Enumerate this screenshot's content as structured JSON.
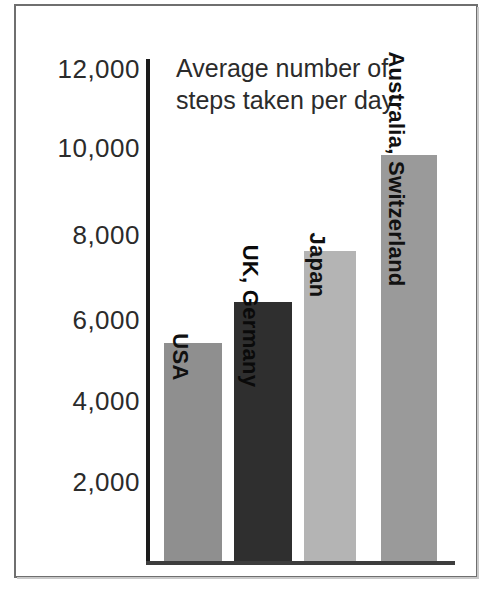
{
  "chart_data": {
    "type": "bar",
    "title": "Average number of steps taken per day",
    "title_line1": "Average number of",
    "title_line2": "steps taken per day",
    "xlabel": "",
    "ylabel": "",
    "ylim": [
      0,
      12000
    ],
    "grid": false,
    "legend": "none",
    "orientation": "vertical",
    "y_ticks": [
      12000,
      10000,
      8000,
      6000,
      4000,
      2000
    ],
    "y_tick_labels": [
      "12,000",
      "10,000",
      "8,000",
      "6,000",
      "4,000",
      "2,000"
    ],
    "categories": [
      "USA",
      "UK, Germany",
      "Japan",
      "Australia, Switzerland"
    ],
    "values": [
      5200,
      6200,
      7400,
      9700
    ],
    "bar_colors": [
      "#8f8f8f",
      "#2f2f2f",
      "#b4b4b4",
      "#9a9a9a"
    ],
    "series": [
      {
        "name": "Average steps per day",
        "values": [
          5200,
          6200,
          7400,
          9700
        ]
      }
    ],
    "annotations": [
      "Bar labels are printed vertically inside each bar"
    ]
  },
  "axis": {
    "tick_0": "12,000",
    "tick_1": "10,000",
    "tick_2": "8,000",
    "tick_3": "6,000",
    "tick_4": "4,000",
    "tick_5": "2,000"
  },
  "bars": [
    {
      "label": "USA",
      "value": 5200,
      "color": "#8f8f8f"
    },
    {
      "label": "UK, Germany",
      "value": 6200,
      "color": "#2f2f2f"
    },
    {
      "label": "Japan",
      "value": 7400,
      "color": "#b4b4b4"
    },
    {
      "label": "Australia, Switzerland",
      "value": 9700,
      "color": "#9a9a9a"
    }
  ]
}
